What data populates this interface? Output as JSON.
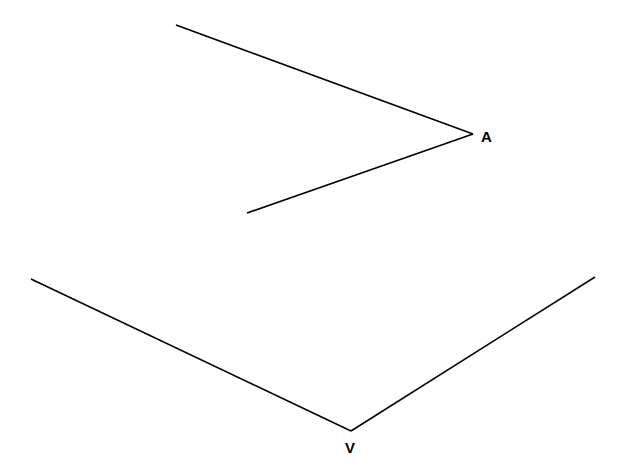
{
  "diagram": {
    "type": "geometry-angles",
    "background": "#ffffff",
    "stroke_color": "#000000",
    "angles": [
      {
        "label": "A",
        "vertex": [
          473,
          134
        ],
        "ray_ends": [
          [
            176,
            25
          ],
          [
            247,
            213
          ]
        ],
        "label_pos": [
          481,
          142
        ]
      },
      {
        "label": "V",
        "vertex": [
          351,
          431
        ],
        "ray_ends": [
          [
            31,
            279
          ],
          [
            595,
            277
          ]
        ],
        "label_pos": [
          345,
          453
        ]
      }
    ]
  }
}
